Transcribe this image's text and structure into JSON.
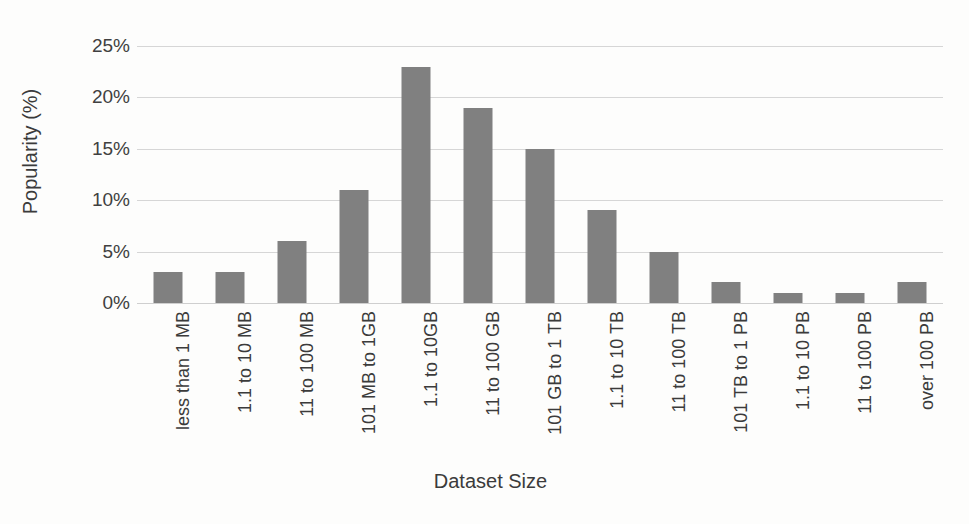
{
  "chart_data": {
    "type": "bar",
    "title": "",
    "xlabel": "Dataset Size",
    "ylabel": "Popularity (%)",
    "categories": [
      "less than 1 MB",
      "1.1 to 10 MB",
      "11 to 100 MB",
      "101 MB to 1GB",
      "1.1 to 10GB",
      "11 to 100 GB",
      "101 GB to 1 TB",
      "1.1 to 10 TB",
      "11 to 100 TB",
      "101 TB to 1 PB",
      "1.1 to 10 PB",
      "11 to 100 PB",
      "over 100 PB"
    ],
    "values": [
      3,
      3,
      6,
      11,
      23,
      19,
      15,
      9,
      5,
      2,
      1,
      1,
      2
    ],
    "ylim": [
      0,
      25
    ],
    "ytick_values": [
      0,
      5,
      10,
      15,
      20,
      25
    ],
    "ytick_labels": [
      "0%",
      "5%",
      "10%",
      "15%",
      "20%",
      "25%"
    ],
    "grid": true,
    "legend": false,
    "bar_color": "#808080",
    "gridline_color": "#d6d6d6",
    "background_color": "#fdfdfc",
    "text_color": "#3b3b3b"
  }
}
